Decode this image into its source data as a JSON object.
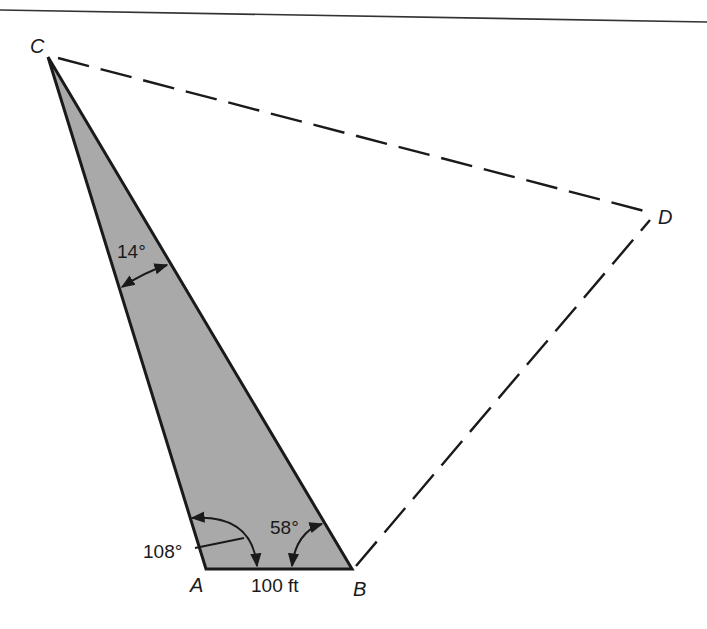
{
  "figure": {
    "type": "surveying-triangle",
    "colors": {
      "ink": "#1a1a1a",
      "fill": "#a9a9a9",
      "background": "#ffffff"
    },
    "vertices": {
      "A": {
        "label": "A",
        "x": 206,
        "y": 569
      },
      "B": {
        "label": "B",
        "x": 352,
        "y": 569
      },
      "C": {
        "label": "C",
        "x": 48,
        "y": 57
      },
      "D": {
        "label": "D",
        "x": 652,
        "y": 213
      }
    },
    "shaded_triangle": [
      "A",
      "B",
      "C"
    ],
    "dashed_lines": [
      [
        "C",
        "D"
      ],
      [
        "B",
        "D"
      ]
    ],
    "angles": {
      "at_C": "14°",
      "at_A": "108°",
      "at_B": "58°"
    },
    "baseline": {
      "from": "A",
      "to": "B",
      "length_label": "100 ft"
    }
  }
}
